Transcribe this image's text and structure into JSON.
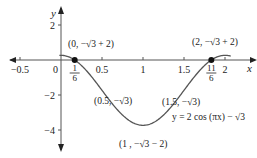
{
  "chart_data": {
    "type": "line",
    "title": "",
    "function_label": "y = 2 cos (πx) − √3",
    "xlabel": "x",
    "ylabel": "y",
    "xlim": [
      -0.5,
      2.1
    ],
    "ylim": [
      -5,
      2.8
    ],
    "grid": false,
    "x_ticks": [
      {
        "value": -0.5,
        "label": "−0.5"
      },
      {
        "value": 0.5,
        "label": "0.5"
      },
      {
        "value": 1,
        "label": "1"
      },
      {
        "value": 1.5,
        "label": "1.5"
      },
      {
        "value": 2,
        "label": "2"
      }
    ],
    "y_ticks": [
      {
        "value": 2,
        "label": "2"
      },
      {
        "value": -2,
        "label": "−2"
      },
      {
        "value": -4,
        "label": "−4"
      }
    ],
    "origin_label": "0",
    "special_x_labels": [
      {
        "value": 0.1667,
        "num": "1",
        "den": "6"
      },
      {
        "value": 1.8333,
        "num": "11",
        "den": "6"
      }
    ],
    "series": [
      {
        "name": "y = 2cos(πx) − √3",
        "x": [
          0,
          0.1667,
          0.25,
          0.5,
          0.75,
          1,
          1.25,
          1.5,
          1.75,
          1.8333,
          2
        ],
        "y": [
          0.268,
          0,
          -0.318,
          -1.732,
          -3.146,
          -3.732,
          -3.146,
          -1.732,
          -0.318,
          0,
          0.268
        ]
      }
    ],
    "annotations": [
      {
        "x": 0,
        "y": 0.268,
        "text": "(0, −√3 + 2)"
      },
      {
        "x": 2,
        "y": 0.268,
        "text": "(2, −√3 + 2)"
      },
      {
        "x": 0.5,
        "y": -1.732,
        "text": "(0.5, −√3)"
      },
      {
        "x": 1.5,
        "y": -1.732,
        "text": "(1.5, −√3)"
      },
      {
        "x": 1,
        "y": -3.732,
        "text": "(1 , −√3 − 2)"
      }
    ],
    "marked_points": [
      {
        "x": 0.1667,
        "y": 0
      },
      {
        "x": 1.8333,
        "y": 0
      }
    ]
  }
}
